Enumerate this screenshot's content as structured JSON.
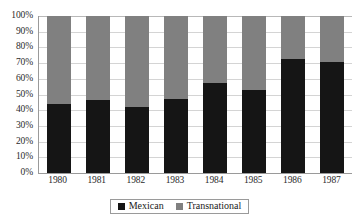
{
  "chart_data": {
    "type": "bar",
    "subtype": "stacked-percentage",
    "title": "",
    "subtitle": "",
    "xlabel": "",
    "ylabel": "",
    "categories": [
      "1980",
      "1981",
      "1982",
      "1983",
      "1984",
      "1985",
      "1986",
      "1987"
    ],
    "series": [
      {
        "name": "Mexican",
        "color": "#151515",
        "values": [
          44,
          46.5,
          42,
          47,
          57.5,
          53,
          72.5,
          70.5
        ]
      },
      {
        "name": "Transnational",
        "color": "#808080",
        "values": [
          56,
          53.5,
          58,
          53,
          42.5,
          47,
          27.5,
          29.5
        ]
      }
    ],
    "ylim": [
      0,
      100
    ],
    "y_ticks": [
      "0%",
      "10%",
      "20%",
      "30%",
      "40%",
      "50%",
      "60%",
      "70%",
      "80%",
      "90%",
      "100%"
    ],
    "y_tick_values": [
      0,
      10,
      20,
      30,
      40,
      50,
      60,
      70,
      80,
      90,
      100
    ],
    "grid": true,
    "legend_position": "bottom",
    "legend_entries": [
      {
        "label": "Mexican",
        "swatch": "black-square",
        "color": "#151515"
      },
      {
        "label": "Transnational",
        "swatch": "gray-square",
        "color": "#808080"
      }
    ]
  },
  "colors": {
    "mexican": "#151515",
    "transnational": "#808080",
    "gridline": "#d4d4d4",
    "axis": "#9a9a9a",
    "text": "#1a1a1a",
    "background": "#ffffff"
  }
}
